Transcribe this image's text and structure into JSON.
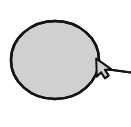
{
  "figure": {
    "background_color": "#ffffff",
    "canvas": {
      "width": 131,
      "height": 127
    }
  },
  "shapes": {
    "balloon": {
      "name": "ellipse-balloon",
      "shape_type": "ellipse",
      "center_x": 55,
      "center_y": 60,
      "radius_x": 45,
      "radius_y": 40,
      "fill_color": "#d2d2d2",
      "stroke_color": "#141414",
      "stroke_width": 2.4,
      "label": ""
    },
    "pointer": {
      "name": "arrow-pointer",
      "shape_type": "cursor-arrow",
      "tip_x": 96,
      "tip_y": 59,
      "fill_color": "#d2d2d2",
      "stroke_color": "#141414",
      "stroke_width": 2.0,
      "direction": "up-left",
      "label": ""
    },
    "leader_line": {
      "name": "leader-line",
      "shape_type": "line",
      "start_x": 110,
      "start_y": 70,
      "end_x": 131,
      "end_y": 72,
      "stroke_color": "#141414",
      "stroke_width": 2.0,
      "label": ""
    }
  },
  "annotations": {
    "captions": []
  }
}
